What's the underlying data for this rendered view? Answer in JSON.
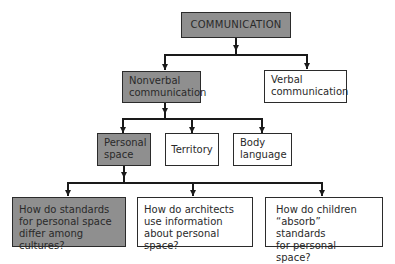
{
  "diagram": {
    "type": "hierarchy",
    "colors": {
      "highlighted_fill": "#8f8f8f",
      "default_fill": "#ffffff",
      "line": "#1a1a1a"
    },
    "root": {
      "label": "COMMUNICATION",
      "highlighted": true
    },
    "level1": [
      {
        "label": "Nonverbal\ncommunication",
        "highlighted": true
      },
      {
        "label": "Verbal\ncommunication",
        "highlighted": false
      }
    ],
    "level2": [
      {
        "label": "Personal\nspace",
        "highlighted": true
      },
      {
        "label": "Territory",
        "highlighted": false
      },
      {
        "label": "Body\nlanguage",
        "highlighted": false
      }
    ],
    "level3": [
      {
        "label": "How do standards\nfor personal space\ndiffer among cultures?",
        "highlighted": true
      },
      {
        "label": "How do architects\nuse information\nabout personal space?",
        "highlighted": false
      },
      {
        "label": "How do children\n“absorb” standards\nfor personal space?",
        "highlighted": false
      }
    ]
  }
}
